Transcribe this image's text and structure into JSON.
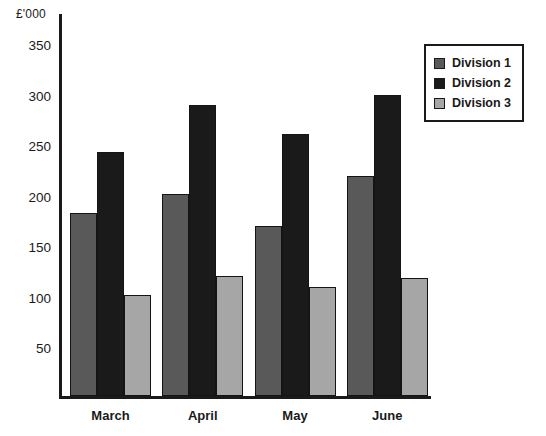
{
  "chart_data": {
    "type": "bar",
    "title": "",
    "subtitle": "",
    "ylabel": "£'000",
    "xlabel": "",
    "categories": [
      "March",
      "April",
      "May",
      "June"
    ],
    "series": [
      {
        "name": "Division 1",
        "color": "#595959",
        "values": [
          181,
          200,
          168,
          218
        ]
      },
      {
        "name": "Division 2",
        "color": "#1a1a1a",
        "values": [
          241,
          288,
          259,
          298
        ]
      },
      {
        "name": "Division 3",
        "color": "#a6a6a6",
        "values": [
          100,
          119,
          108,
          117
        ]
      }
    ],
    "yticks": [
      50,
      100,
      150,
      200,
      250,
      300,
      350
    ],
    "ytick_labels": [
      "50",
      "100",
      "150",
      "200",
      "250",
      "300",
      "350"
    ],
    "ylim": [
      0,
      378
    ],
    "grid": false,
    "legend_position": "top-right",
    "legend_entries": [
      "Division 1",
      "Division 2",
      "Division 3"
    ]
  },
  "axis": {
    "y_title": "£'000"
  },
  "legend": {
    "items": [
      {
        "label": "Division 1"
      },
      {
        "label": "Division 2"
      },
      {
        "label": "Division 3"
      }
    ]
  },
  "colors": {
    "division1": "#595959",
    "division2": "#1a1a1a",
    "division3": "#a6a6a6",
    "axis": "#1a1a1a",
    "background": "#ffffff"
  }
}
